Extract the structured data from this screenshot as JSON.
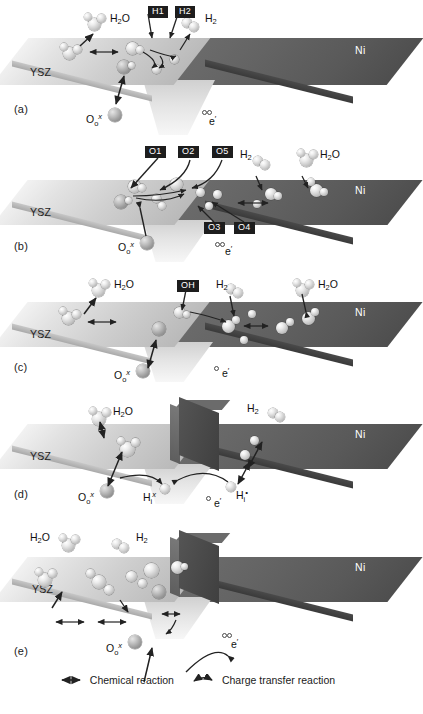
{
  "figure": {
    "type": "schematic-diagram",
    "panels": [
      {
        "id": "a",
        "letter": "(a)",
        "left_phase": "YSZ",
        "right_phase": "Ni",
        "species": [
          "H2O",
          "H2"
        ],
        "boxed_labels": [
          "H1",
          "H2"
        ],
        "kroger_vink": [
          "O_o^x",
          "e'"
        ]
      },
      {
        "id": "b",
        "letter": "(b)",
        "left_phase": "YSZ",
        "right_phase": "Ni",
        "species": [
          "H2",
          "H2O"
        ],
        "boxed_labels": [
          "O1",
          "O2",
          "O5",
          "O3",
          "O4"
        ],
        "kroger_vink": [
          "O_o^x",
          "e'"
        ]
      },
      {
        "id": "c",
        "letter": "(c)",
        "left_phase": "YSZ",
        "right_phase": "Ni",
        "species": [
          "H2O",
          "H2",
          "H2O"
        ],
        "boxed_labels": [
          "OH"
        ],
        "kroger_vink": [
          "O_o^x",
          "e'"
        ]
      },
      {
        "id": "d",
        "letter": "(d)",
        "left_phase": "YSZ",
        "right_phase": "Ni",
        "species": [
          "H2O",
          "H2"
        ],
        "boxed_labels": [],
        "kroger_vink": [
          "O_o^x",
          "H_i^x",
          "H_i^•",
          "e'"
        ]
      },
      {
        "id": "e",
        "letter": "(e)",
        "left_phase": "YSZ",
        "right_phase": "Ni",
        "species": [
          "H2O",
          "H2"
        ],
        "boxed_labels": [],
        "kroger_vink": [
          "O_o^x",
          "e'"
        ]
      }
    ],
    "labels": {
      "ysz": "YSZ",
      "ni": "Ni",
      "water": {
        "base": "H",
        "sub": "2",
        "tail": "O"
      },
      "hydrogen": {
        "base": "H",
        "sub": "2"
      },
      "oxygen_site": {
        "base": "O",
        "sub": "o",
        "sup": "x"
      },
      "h_interstitial_neutral": {
        "base": "H",
        "sub": "i",
        "sup": "x"
      },
      "h_interstitial_charged": {
        "base": "H",
        "sub": "i",
        "sup": "•"
      },
      "electron": {
        "base": "e",
        "sup": "′"
      },
      "hydroxyl": "OH"
    },
    "legend": {
      "items": [
        {
          "icon": "double-arrow-straight",
          "label": "Chemical reaction"
        },
        {
          "icon": "curved-arrow",
          "label": "Charge transfer reaction"
        }
      ]
    },
    "colors": {
      "ysz_slab": "#d8d8d8",
      "ni_slab": "#5c5c5c",
      "box_label_bg": "#1d1d1d",
      "box_label_text": "#ffffff",
      "arrow": "#2a2a2a",
      "background": "#ffffff"
    }
  }
}
